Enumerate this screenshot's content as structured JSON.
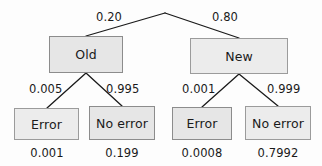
{
  "diagram": {
    "type": "probability-tree",
    "title": "",
    "root": {
      "label": "",
      "x": 165,
      "y": 13
    },
    "nodes": [
      {
        "id": "old",
        "label": "Old",
        "level": 1,
        "x": 49,
        "y": 36,
        "w": 74,
        "h": 37,
        "shade": "dark"
      },
      {
        "id": "new",
        "label": "New",
        "level": 1,
        "x": 190,
        "y": 38,
        "w": 98,
        "h": 36,
        "shade": "light"
      },
      {
        "id": "old-error",
        "label": "Error",
        "level": 2,
        "x": 14,
        "y": 108,
        "w": 65,
        "h": 32,
        "shade": "light"
      },
      {
        "id": "old-noerr",
        "label": "No error",
        "level": 2,
        "x": 89,
        "y": 106,
        "w": 66,
        "h": 34,
        "shade": "dark"
      },
      {
        "id": "new-error",
        "label": "Error",
        "level": 2,
        "x": 172,
        "y": 107,
        "w": 60,
        "h": 33,
        "shade": "dark"
      },
      {
        "id": "new-noerr",
        "label": "No error",
        "level": 2,
        "x": 245,
        "y": 106,
        "w": 66,
        "h": 34,
        "shade": "light"
      }
    ],
    "branch_labels": [
      {
        "id": "p-old",
        "text": "0.20",
        "x": 96,
        "y": 10
      },
      {
        "id": "p-new",
        "text": "0.80",
        "x": 212,
        "y": 10
      },
      {
        "id": "p-error-old",
        "text": "0.005",
        "x": 29,
        "y": 82
      },
      {
        "id": "p-noerror-old",
        "text": "0.995",
        "x": 106,
        "y": 82
      },
      {
        "id": "p-error-new",
        "text": "0.001",
        "x": 182,
        "y": 82
      },
      {
        "id": "p-noerror-new",
        "text": "0.999",
        "x": 267,
        "y": 82
      }
    ],
    "leaf_values": [
      {
        "id": "joint-old-error",
        "text": "0.001",
        "cx": 47,
        "y": 146
      },
      {
        "id": "joint-old-noerr",
        "text": "0.199",
        "cx": 122,
        "y": 146
      },
      {
        "id": "joint-new-error",
        "text": "0.0008",
        "cx": 202,
        "y": 146
      },
      {
        "id": "joint-new-noerr",
        "text": "0.7992",
        "cx": 278,
        "y": 146
      }
    ],
    "edges": [
      {
        "id": "edge-root-old",
        "x1": 165,
        "y1": 13,
        "x2": 86,
        "y2": 36
      },
      {
        "id": "edge-root-new",
        "x1": 165,
        "y1": 13,
        "x2": 239,
        "y2": 38
      },
      {
        "id": "edge-old-error",
        "x1": 86,
        "y1": 73,
        "x2": 47,
        "y2": 108
      },
      {
        "id": "edge-old-noerror",
        "x1": 86,
        "y1": 73,
        "x2": 122,
        "y2": 106
      },
      {
        "id": "edge-new-error",
        "x1": 239,
        "y1": 74,
        "x2": 202,
        "y2": 107
      },
      {
        "id": "edge-new-noerror",
        "x1": 239,
        "y1": 74,
        "x2": 278,
        "y2": 106
      }
    ],
    "colors": {
      "node_fill_dark": "#e6e6e6",
      "node_fill_light": "#ececec",
      "node_border": "#8c8c8c",
      "edge_stroke": "#1a1a1a",
      "text": "#1a1a1a",
      "background": "#fdfdfd"
    }
  }
}
